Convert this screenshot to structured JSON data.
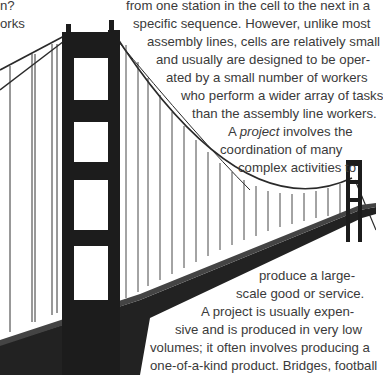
{
  "left_fragment": {
    "lines": [
      "n?",
      "orks"
    ]
  },
  "paragraph_top": {
    "lines": [
      "from one station in the cell to the next in a",
      "specific sequence. However, unlike most",
      "assembly lines, cells are relatively small",
      "and usually are designed to be oper-",
      "ated by a small number of workers",
      "who perform a wider array of tasks",
      "than the assembly line workers."
    ]
  },
  "project_intro": {
    "prefix": "A ",
    "term": "project",
    "suffix": " involves the",
    "line2": "coordination of many",
    "line3": "complex activities to"
  },
  "paragraph_bottom": {
    "lines": [
      "produce a large-",
      "scale good or service.",
      "A project is usually expen-",
      "sive and is produced in very low",
      "volumes; it often involves producing a",
      "one-of-a-kind product. Bridges, football"
    ]
  },
  "image": {
    "subject": "suspension-bridge-photo",
    "colors": {
      "tower": "#1c1c1c",
      "cable": "#2a2a2a",
      "text": "#3a3a3a"
    }
  }
}
